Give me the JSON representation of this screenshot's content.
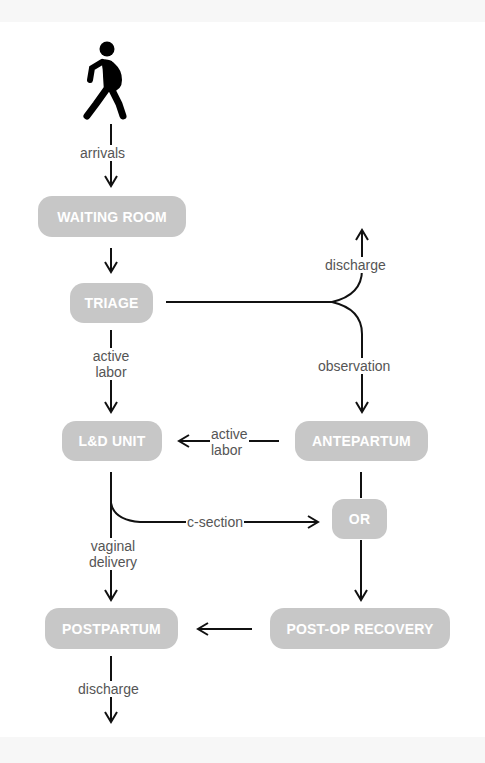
{
  "nodes": {
    "waiting_room": "WAITING ROOM",
    "triage": "TRIAGE",
    "ld_unit": "L&D UNIT",
    "antepartum": "ANTEPARTUM",
    "or": "OR",
    "postpartum": "POSTPARTUM",
    "post_op_recovery": "POST-OP RECOVERY"
  },
  "edges": {
    "arrivals": "arrivals",
    "triage_discharge": "discharge",
    "observation": "observation",
    "active_labor_triage_1": "active",
    "active_labor_triage_2": "labor",
    "active_labor_ante_1": "active",
    "active_labor_ante_2": "labor",
    "c_section": "c-section",
    "vaginal_delivery_1": "vaginal",
    "vaginal_delivery_2": "delivery",
    "postpartum_discharge": "discharge"
  },
  "icons": {
    "start": "pregnant-person-walking-icon"
  },
  "colors": {
    "node_fill": "#c7c7c7",
    "node_text": "#ffffff",
    "line": "#111111",
    "label_text": "#555555"
  }
}
